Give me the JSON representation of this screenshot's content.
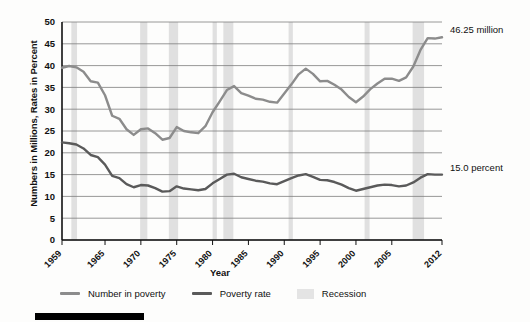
{
  "chart_data": {
    "type": "line",
    "title": "",
    "xlabel": "Year",
    "ylabel": "Numbers in Millions, Rates in Percent",
    "xlim": [
      1959,
      2012
    ],
    "ylim": [
      0,
      50
    ],
    "ytick_step": 5,
    "yticks": [
      0,
      5,
      10,
      15,
      20,
      25,
      30,
      35,
      40,
      45,
      50
    ],
    "xticks": [
      1959,
      1965,
      1970,
      1975,
      1980,
      1985,
      1990,
      1995,
      2000,
      2005,
      2012
    ],
    "xtick_labels": [
      "1959",
      "1965",
      "1970",
      "1975",
      "1980",
      "1985",
      "1990",
      "1995",
      "2000",
      "2005",
      "2012"
    ],
    "grid": "horizontal",
    "legend_position": "bottom",
    "x": [
      1959,
      1960,
      1961,
      1962,
      1963,
      1964,
      1965,
      1966,
      1967,
      1968,
      1969,
      1970,
      1971,
      1972,
      1973,
      1974,
      1975,
      1976,
      1977,
      1978,
      1979,
      1980,
      1981,
      1982,
      1983,
      1984,
      1985,
      1986,
      1987,
      1988,
      1989,
      1990,
      1991,
      1992,
      1993,
      1994,
      1995,
      1996,
      1997,
      1998,
      1999,
      2000,
      2001,
      2002,
      2003,
      2004,
      2005,
      2006,
      2007,
      2008,
      2009,
      2010,
      2011,
      2012
    ],
    "series": [
      {
        "name": "Number in poverty",
        "units": "millions",
        "color": "#8c8c8c",
        "values": [
          39.5,
          39.9,
          39.6,
          38.6,
          36.4,
          36.1,
          33.2,
          28.5,
          27.8,
          25.4,
          24.1,
          25.4,
          25.6,
          24.5,
          23.0,
          23.4,
          25.9,
          25.0,
          24.7,
          24.5,
          26.1,
          29.3,
          31.8,
          34.4,
          35.3,
          33.7,
          33.1,
          32.4,
          32.2,
          31.7,
          31.5,
          33.6,
          35.7,
          38.0,
          39.3,
          38.1,
          36.4,
          36.5,
          35.6,
          34.5,
          32.8,
          31.6,
          32.9,
          34.6,
          35.9,
          37.0,
          37.0,
          36.5,
          37.3,
          39.8,
          43.6,
          46.3,
          46.2,
          46.5
        ],
        "last_value_label": "46.25 million"
      },
      {
        "name": "Poverty rate",
        "units": "percent",
        "color": "#5a5a5a",
        "values": [
          22.4,
          22.2,
          21.9,
          21.0,
          19.5,
          19.0,
          17.3,
          14.7,
          14.2,
          12.8,
          12.1,
          12.6,
          12.5,
          11.9,
          11.1,
          11.2,
          12.3,
          11.8,
          11.6,
          11.4,
          11.7,
          13.0,
          14.0,
          15.0,
          15.2,
          14.4,
          14.0,
          13.6,
          13.4,
          13.0,
          12.8,
          13.5,
          14.2,
          14.8,
          15.1,
          14.5,
          13.8,
          13.7,
          13.3,
          12.7,
          11.9,
          11.3,
          11.7,
          12.1,
          12.5,
          12.7,
          12.6,
          12.3,
          12.5,
          13.2,
          14.3,
          15.1,
          15.0,
          15.0
        ],
        "last_value_label": "15.0 percent"
      }
    ],
    "recession_bands": [
      {
        "start": 1960.3,
        "end": 1961.1
      },
      {
        "start": 1969.9,
        "end": 1970.9
      },
      {
        "start": 1973.9,
        "end": 1975.2
      },
      {
        "start": 1980.0,
        "end": 1980.6
      },
      {
        "start": 1981.5,
        "end": 1982.9
      },
      {
        "start": 1990.6,
        "end": 1991.2
      },
      {
        "start": 2001.2,
        "end": 2001.9
      },
      {
        "start": 2007.9,
        "end": 2009.5
      }
    ],
    "recession_color": "#e0e0e0",
    "annotations": [
      {
        "text": "46.25 million",
        "series": "Number in poverty",
        "at_x": 2012
      },
      {
        "text": "15.0 percent",
        "series": "Poverty rate",
        "at_x": 2012
      }
    ]
  },
  "legend": {
    "items": [
      {
        "label": "Number in poverty",
        "type": "line",
        "color": "#8c8c8c"
      },
      {
        "label": "Poverty rate",
        "type": "line",
        "color": "#5a5a5a"
      },
      {
        "label": "Recession",
        "type": "box",
        "color": "#e4e4e4"
      }
    ]
  },
  "axes": {
    "y_title": "Numbers in Millions, Rates in Percent",
    "x_title": "Year"
  }
}
